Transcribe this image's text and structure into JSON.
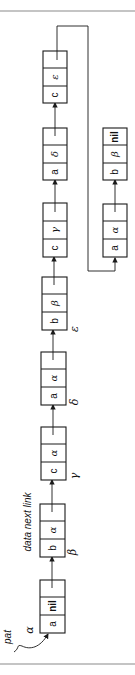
{
  "diagram": {
    "orientation": "rotated-90-ccw",
    "pointer_label": "pat",
    "field_header": "data next link",
    "main_list": [
      {
        "address": "α",
        "data": "a",
        "next": "nil",
        "link": ""
      },
      {
        "address": "β",
        "data": "b",
        "next": "α",
        "link": ""
      },
      {
        "address": "γ",
        "data": "c",
        "next": "α",
        "link": ""
      },
      {
        "address": "δ",
        "data": "a",
        "next": "α",
        "link": ""
      },
      {
        "address": "ε",
        "data": "b",
        "next": "β",
        "link": ""
      },
      {
        "address": "",
        "data": "c",
        "next": "γ",
        "link": ""
      },
      {
        "address": "",
        "data": "a",
        "next": "δ",
        "link": ""
      },
      {
        "address": "",
        "data": "c",
        "next": "ε",
        "link": ""
      }
    ],
    "second_list": [
      {
        "data": "a",
        "next": "α",
        "link": ""
      },
      {
        "data": "b",
        "next": "β",
        "link": ""
      },
      {
        "data": "",
        "next": "nil",
        "link": ""
      }
    ],
    "colors": {
      "line": "#1a1a1a",
      "rule": "#8a8a8a",
      "background": "#ffffff"
    }
  }
}
